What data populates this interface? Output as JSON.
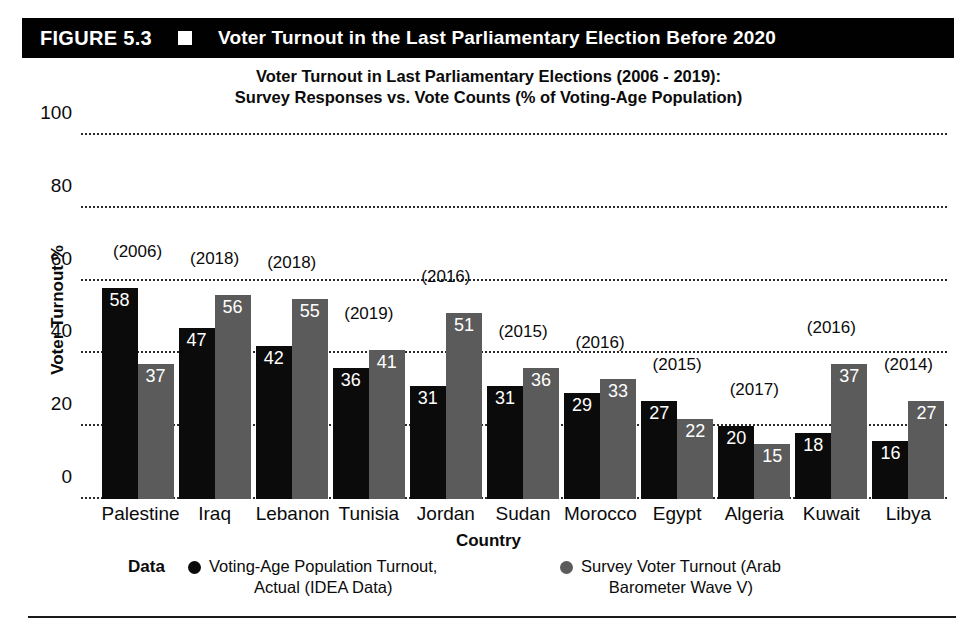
{
  "figure": {
    "number_label": "FIGURE 5.3",
    "marker_icon": "white-square",
    "title": "Voter Turnout in the Last Parliamentary Election Before 2020",
    "header_background": "#010101",
    "header_text_color": "#ffffff"
  },
  "chart_data": {
    "type": "bar",
    "title": "Voter Turnout in Last Parliamentary Elections (2006 - 2019):",
    "subtitle": "Survey Responses vs. Vote Counts (% of  Voting-Age Population)",
    "xlabel": "Country",
    "ylabel": "Voter Turnout %",
    "ylim": [
      0,
      100
    ],
    "yticks": [
      0,
      20,
      40,
      60,
      80,
      100
    ],
    "grid": "horizontal-dotted",
    "legend_position": "bottom",
    "legend_title": "Data",
    "categories": [
      "Palestine",
      "Iraq",
      "Lebanon",
      "Tunisia",
      "Jordan",
      "Sudan",
      "Morocco",
      "Egypt",
      "Algeria",
      "Kuwait",
      "Libya"
    ],
    "annotations": {
      "label": "election year",
      "values": [
        "(2006)",
        "(2018)",
        "(2018)",
        "(2019)",
        "(2016)",
        "(2015)",
        "(2016)",
        "(2015)",
        "(2017)",
        "(2016)",
        "(2014)"
      ]
    },
    "series": [
      {
        "name": "Voting-Age Population Turnout, Actual (IDEA Data)",
        "color": "#0b0b0b",
        "values": [
          58,
          47,
          42,
          36,
          31,
          31,
          29,
          27,
          20,
          18,
          16
        ]
      },
      {
        "name": "Survey Voter Turnout (Arab Barometer Wave V)",
        "color": "#5b5b5b",
        "values": [
          37,
          56,
          55,
          41,
          51,
          36,
          33,
          22,
          15,
          37,
          27
        ]
      }
    ]
  },
  "legend": {
    "title": "Data",
    "entries": [
      {
        "marker": "black-circle",
        "line1": "Voting-Age Population Turnout,",
        "line2": "Actual (IDEA Data)"
      },
      {
        "marker": "gray-circle",
        "line1": "Survey Voter Turnout (Arab",
        "line2": "Barometer Wave V)"
      }
    ]
  }
}
